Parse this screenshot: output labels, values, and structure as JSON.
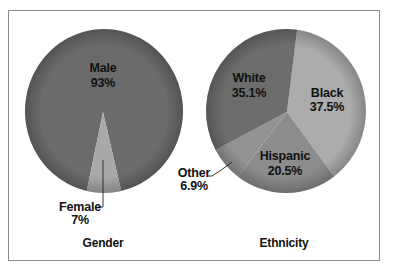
{
  "chart_data": [
    {
      "type": "pie",
      "title": "Gender",
      "categories": [
        "Male",
        "Female"
      ],
      "values": [
        93,
        7
      ],
      "labels": [
        "93%",
        "7%"
      ],
      "colors": [
        "#6b6b6b",
        "#a9a9a9"
      ],
      "legend": "none (direct labels)"
    },
    {
      "type": "pie",
      "title": "Ethnicity",
      "categories": [
        "Black",
        "Hispanic",
        "Other",
        "White"
      ],
      "values": [
        37.5,
        20.5,
        6.9,
        35.1
      ],
      "labels": [
        "37.5%",
        "20.5%",
        "6.9%",
        "35.1%"
      ],
      "colors": [
        "#acacac",
        "#8c8c8c",
        "#939393",
        "#6d6d6d"
      ],
      "legend": "none (direct labels)"
    }
  ],
  "gender": {
    "title": "Gender",
    "male": {
      "name": "Male",
      "pct": "93%"
    },
    "female": {
      "name": "Female",
      "pct": "7%"
    }
  },
  "ethnicity": {
    "title": "Ethnicity",
    "white": {
      "name": "White",
      "pct": "35.1%"
    },
    "black": {
      "name": "Black",
      "pct": "37.5%"
    },
    "hispanic": {
      "name": "Hispanic",
      "pct": "20.5%"
    },
    "other": {
      "name": "Other",
      "pct": "6.9%"
    }
  }
}
